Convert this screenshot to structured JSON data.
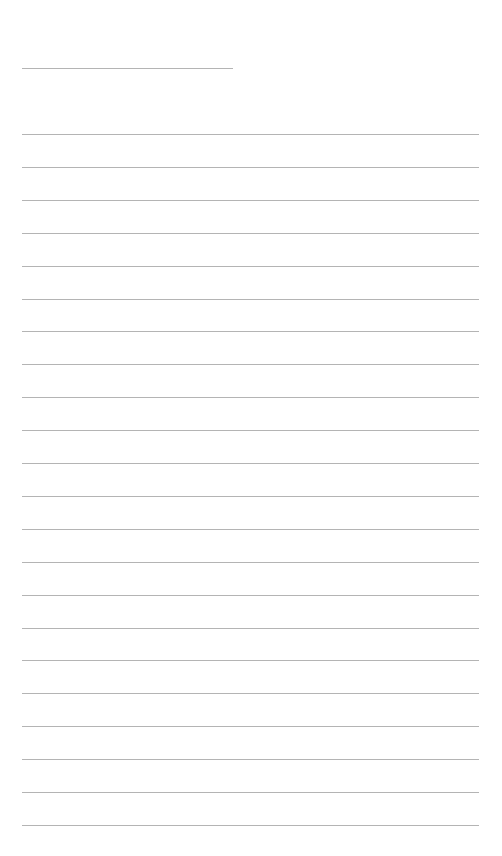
{
  "page": {
    "background": "#ffffff",
    "line_color": "#b4b4b4"
  },
  "header_field": {
    "x": 22,
    "y": 68,
    "width": 211,
    "text": ""
  },
  "ruled_lines": {
    "x": 22,
    "width": 457,
    "start_y": 134,
    "spacing": 32.9,
    "count": 22,
    "lines": [
      "",
      "",
      "",
      "",
      "",
      "",
      "",
      "",
      "",
      "",
      "",
      "",
      "",
      "",
      "",
      "",
      "",
      "",
      "",
      "",
      "",
      ""
    ]
  }
}
